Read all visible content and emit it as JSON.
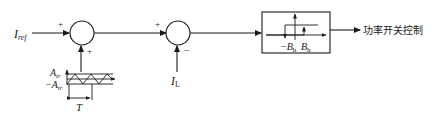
{
  "diagram": {
    "type": "block-diagram",
    "title": "",
    "inputs": {
      "reference": {
        "symbol": "I",
        "subscript": "ref"
      },
      "feedback": {
        "symbol": "I",
        "subscript": "L"
      }
    },
    "junction1": {
      "sign_left": "+",
      "sign_bottom": "+"
    },
    "junction2": {
      "sign_left": "+",
      "sign_bottom": "−"
    },
    "triangle_wave": {
      "amp_pos": {
        "symbol": "A",
        "subscript": "tr"
      },
      "amp_neg": {
        "prefix": "−",
        "symbol": "A",
        "subscript": "tr"
      },
      "period": "T"
    },
    "hysteresis_block": {
      "neg_band": {
        "prefix": "−",
        "symbol": "B",
        "subscript": "h"
      },
      "pos_band": {
        "symbol": "B",
        "subscript": "h"
      }
    },
    "output_label": "功率开关控制"
  }
}
